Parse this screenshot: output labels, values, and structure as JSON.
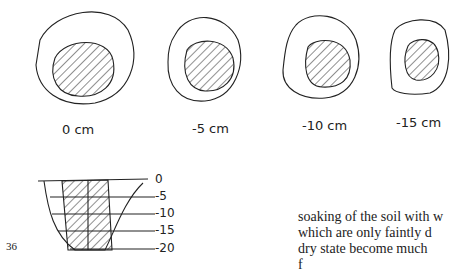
{
  "figure": {
    "sections": [
      {
        "label": "0 cm"
      },
      {
        "label": "-5 cm"
      },
      {
        "label": "-10 cm"
      },
      {
        "label": "-15 cm"
      }
    ],
    "profile_depths": [
      "0",
      "-5",
      "-10",
      "-15",
      "-20"
    ]
  },
  "page_number": "36",
  "body_text": [
    "soaking of the soil with w",
    "which are only faintly d",
    "dry state become much",
    "f"
  ]
}
